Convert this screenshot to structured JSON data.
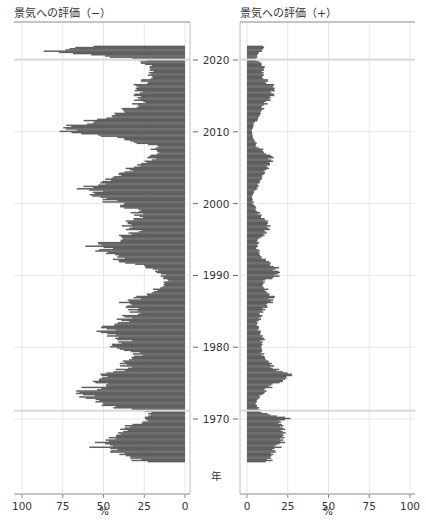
{
  "chart_data": [
    {
      "type": "bar",
      "orientation": "horizontal",
      "title": "景気への評価（−）",
      "xlabel": "%",
      "ylabel": "年",
      "xlim": [
        100,
        0
      ],
      "x_reversed": true,
      "xticks": [
        100,
        75,
        50,
        25,
        0
      ],
      "ylim": [
        1964,
        2022
      ],
      "yticks": [
        1970,
        1980,
        1990,
        2000,
        2010,
        2020
      ],
      "grid": true,
      "bar_color": "#5f5f5f",
      "years": [
        1964,
        1965,
        1966,
        1967,
        1968,
        1969,
        1970,
        1971,
        1972,
        1973,
        1974,
        1975,
        1976,
        1977,
        1978,
        1979,
        1980,
        1981,
        1982,
        1983,
        1984,
        1985,
        1986,
        1987,
        1988,
        1989,
        1990,
        1991,
        1992,
        1993,
        1994,
        1995,
        1996,
        1997,
        1998,
        1999,
        2000,
        2001,
        2002,
        2003,
        2004,
        2005,
        2006,
        2007,
        2008,
        2009,
        2010,
        2011,
        2012,
        2013,
        2014,
        2015,
        2016,
        2017,
        2018,
        2019,
        2020,
        2021,
        2022
      ],
      "values": [
        28,
        40,
        55,
        48,
        38,
        33,
        22,
        25,
        58,
        65,
        62,
        55,
        48,
        40,
        35,
        30,
        42,
        38,
        50,
        45,
        36,
        32,
        38,
        28,
        18,
        12,
        14,
        22,
        42,
        50,
        55,
        45,
        30,
        38,
        30,
        30,
        45,
        55,
        62,
        50,
        40,
        35,
        22,
        18,
        20,
        40,
        78,
        65,
        50,
        40,
        28,
        30,
        32,
        25,
        22,
        20,
        30,
        85,
        60
      ]
    },
    {
      "type": "bar",
      "orientation": "horizontal",
      "title": "景気への評価（+）",
      "xlabel": "%",
      "ylabel": "年",
      "xlim": [
        0,
        100
      ],
      "xticks": [
        0,
        25,
        50,
        75,
        100
      ],
      "ylim": [
        1964,
        2022
      ],
      "yticks": [
        1970,
        1980,
        1990,
        2000,
        2010,
        2020
      ],
      "grid": true,
      "bar_color": "#5f5f5f",
      "years": [
        1964,
        1965,
        1966,
        1967,
        1968,
        1969,
        1970,
        1971,
        1972,
        1973,
        1974,
        1975,
        1976,
        1977,
        1978,
        1979,
        1980,
        1981,
        1982,
        1983,
        1984,
        1985,
        1986,
        1987,
        1988,
        1989,
        1990,
        1991,
        1992,
        1993,
        1994,
        1995,
        1996,
        1997,
        1998,
        1999,
        2000,
        2001,
        2002,
        2003,
        2004,
        2005,
        2006,
        2007,
        2008,
        2009,
        2010,
        2011,
        2012,
        2013,
        2014,
        2015,
        2016,
        2017,
        2018,
        2019,
        2020,
        2021,
        2022
      ],
      "values": [
        14,
        16,
        20,
        22,
        22,
        20,
        24,
        8,
        6,
        8,
        12,
        20,
        26,
        18,
        12,
        10,
        8,
        10,
        8,
        6,
        8,
        10,
        14,
        16,
        12,
        10,
        20,
        18,
        12,
        8,
        6,
        8,
        12,
        14,
        10,
        6,
        4,
        3,
        6,
        8,
        10,
        14,
        16,
        12,
        6,
        4,
        3,
        4,
        8,
        10,
        12,
        16,
        18,
        12,
        10,
        10,
        6,
        8,
        12
      ]
    }
  ],
  "panels": {
    "left": {
      "title": "景気への評価（−）",
      "xlabel": "%",
      "xtick_labels": [
        "100",
        "75",
        "50",
        "25",
        "0"
      ]
    },
    "right": {
      "title": "景気への評価（+）",
      "xlabel": "%",
      "xtick_labels": [
        "0",
        "25",
        "50",
        "75",
        "100"
      ]
    },
    "year_axis": {
      "label": "年",
      "tick_labels": [
        "2020",
        "2010",
        "2000",
        "1990",
        "1980",
        "1970"
      ]
    }
  }
}
